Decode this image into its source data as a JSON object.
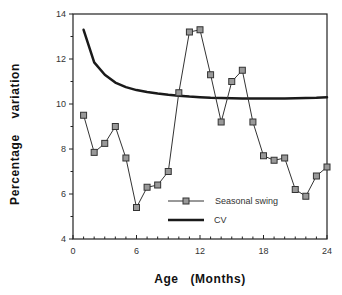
{
  "chart_data": {
    "type": "line",
    "title": "",
    "xlabel": "Age   (Months)",
    "ylabel": "Percentage    variation",
    "xlim": [
      0,
      24
    ],
    "ylim": [
      4,
      14
    ],
    "xticks": [
      0,
      6,
      12,
      18,
      24
    ],
    "yticks": [
      4,
      6,
      8,
      10,
      12,
      14
    ],
    "x_minor_step": 1,
    "y_minor_step": 1,
    "grid": false,
    "legend_position": "lower center-right, inside plot",
    "series": [
      {
        "name": "Seasonal swing",
        "marker": "square",
        "line_width": 1,
        "color": "#333333",
        "x": [
          1,
          2,
          3,
          4,
          5,
          6,
          7,
          8,
          9,
          10,
          11,
          12,
          13,
          14,
          15,
          16,
          17,
          18,
          19,
          20,
          21,
          22,
          23,
          24
        ],
        "values": [
          9.5,
          7.85,
          8.25,
          9.0,
          7.6,
          5.4,
          6.3,
          6.4,
          7.0,
          10.5,
          13.2,
          13.3,
          11.3,
          9.2,
          11.0,
          11.5,
          9.2,
          7.7,
          7.5,
          7.6,
          6.2,
          5.9,
          6.8,
          7.2
        ]
      },
      {
        "name": "CV",
        "marker": "none",
        "line_width": 2.5,
        "color": "#1a1a1a",
        "x": [
          1,
          2,
          3,
          4,
          5,
          6,
          7,
          8,
          9,
          10,
          11,
          12,
          13,
          14,
          15,
          16,
          17,
          18,
          19,
          20,
          21,
          22,
          23,
          24
        ],
        "values": [
          13.3,
          11.85,
          11.3,
          10.95,
          10.75,
          10.62,
          10.53,
          10.46,
          10.41,
          10.37,
          10.33,
          10.3,
          10.28,
          10.27,
          10.26,
          10.25,
          10.24,
          10.24,
          10.25,
          10.25,
          10.26,
          10.27,
          10.28,
          10.3
        ]
      }
    ]
  },
  "legend": {
    "items": [
      {
        "label": "Seasonal swing",
        "style": "line-square-marker"
      },
      {
        "label": "CV",
        "style": "thick-line"
      }
    ]
  },
  "axes": {
    "x_title": "Age   (Months)",
    "y_title": "Percentage    variation"
  }
}
